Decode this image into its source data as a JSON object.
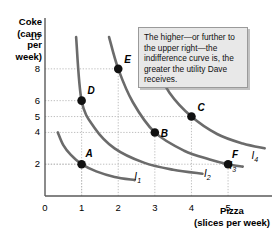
{
  "figure": {
    "background_color": "#ffffff",
    "curve_color": "#6b6b6b",
    "point_color": "#111111",
    "grid_color": "#b8b8b8",
    "axis_color": "#5a5a5a"
  },
  "callout": {
    "text": "The higher—or further to the upper right—the indifference curve is, the greater the utility Dave receives.",
    "background_color": "#e8e8e8",
    "border_color": "#9a9a9a"
  },
  "chart_data": {
    "type": "line",
    "title": "",
    "xlabel": "Pizza\n(slices per week)",
    "ylabel": "Coke\n(cans\nper\nweek)",
    "xlabel_line1": "Pizza",
    "xlabel_line2": "(slices per week)",
    "ylabel_line1": "Coke",
    "ylabel_line2": "(cans",
    "ylabel_line3": "per",
    "ylabel_line4": "week)",
    "xlim": [
      0,
      6.2
    ],
    "ylim": [
      0,
      11.2
    ],
    "xticks": [
      0,
      1,
      2,
      3,
      4,
      5
    ],
    "xtick_labels": [
      "0",
      "1",
      "2",
      "3",
      "4",
      "5"
    ],
    "yticks": [
      2,
      4,
      5,
      6,
      8,
      10
    ],
    "ytick_labels": [
      "2",
      "4",
      "5",
      "6",
      "8",
      "10"
    ],
    "grid": "dotted-guides-to-points",
    "legend": "inline-curve-labels",
    "series": [
      {
        "name": "I1",
        "label": "I",
        "sub": "1",
        "label_x": 2.55,
        "label_y": 0.95,
        "points": [
          {
            "x": 0.35,
            "y": 4.0
          },
          {
            "x": 0.5,
            "y": 3.2
          },
          {
            "x": 0.7,
            "y": 2.6
          },
          {
            "x": 1.0,
            "y": 2.0
          },
          {
            "x": 1.4,
            "y": 1.55
          },
          {
            "x": 1.9,
            "y": 1.2
          },
          {
            "x": 2.45,
            "y": 1.0
          }
        ]
      },
      {
        "name": "I2",
        "label": "I",
        "sub": "2",
        "label_x": 4.45,
        "label_y": 1.12,
        "points": [
          {
            "x": 0.85,
            "y": 10.0
          },
          {
            "x": 1.0,
            "y": 6.0
          },
          {
            "x": 1.35,
            "y": 4.3
          },
          {
            "x": 1.9,
            "y": 3.0
          },
          {
            "x": 2.7,
            "y": 2.1
          },
          {
            "x": 3.5,
            "y": 1.65
          },
          {
            "x": 4.3,
            "y": 1.4
          }
        ]
      },
      {
        "name": "I3",
        "label": "I",
        "sub": "3",
        "label_x": 5.15,
        "label_y": 1.65,
        "points": [
          {
            "x": 1.75,
            "y": 10.0
          },
          {
            "x": 2.0,
            "y": 8.0
          },
          {
            "x": 2.4,
            "y": 5.9
          },
          {
            "x": 3.0,
            "y": 4.0
          },
          {
            "x": 3.8,
            "y": 2.85
          },
          {
            "x": 4.5,
            "y": 2.3
          },
          {
            "x": 5.0,
            "y": 2.0
          },
          {
            "x": 5.4,
            "y": 1.85
          }
        ]
      },
      {
        "name": "I4",
        "label": "I",
        "sub": "4",
        "label_x": 5.75,
        "label_y": 2.25,
        "points": [
          {
            "x": 2.75,
            "y": 10.0
          },
          {
            "x": 3.0,
            "y": 8.3
          },
          {
            "x": 3.4,
            "y": 6.5
          },
          {
            "x": 4.0,
            "y": 5.0
          },
          {
            "x": 4.7,
            "y": 3.9
          },
          {
            "x": 5.4,
            "y": 3.3
          },
          {
            "x": 6.0,
            "y": 3.0
          }
        ]
      }
    ],
    "points": [
      {
        "label": "A",
        "x": 1,
        "y": 2,
        "label_dx": 4,
        "label_dy": -16,
        "curve": "I1"
      },
      {
        "label": "B",
        "x": 3,
        "y": 4,
        "label_dx": 6,
        "label_dy": -4,
        "curve": "I3"
      },
      {
        "label": "C",
        "x": 4,
        "y": 5,
        "label_dx": 6,
        "label_dy": -15,
        "curve": "I4"
      },
      {
        "label": "D",
        "x": 1,
        "y": 6,
        "label_dx": 6,
        "label_dy": -16,
        "curve": "I2"
      },
      {
        "label": "E",
        "x": 2,
        "y": 8,
        "label_dx": 6,
        "label_dy": -15,
        "curve": "I3"
      },
      {
        "label": "F",
        "x": 5,
        "y": 2,
        "label_dx": 4,
        "label_dy": -15,
        "curve": "I3"
      }
    ]
  }
}
